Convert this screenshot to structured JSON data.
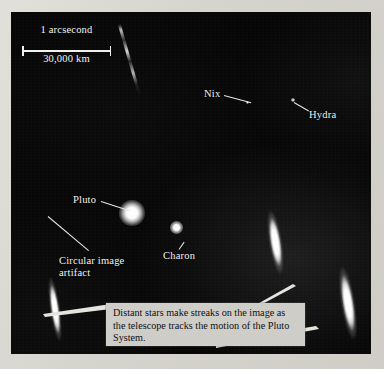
{
  "figure": {
    "kind": "telescope-photograph",
    "background_color": "#050505",
    "page_color": "#d8d6d0"
  },
  "scale_bar": {
    "top_label": "1 arcsecond",
    "bottom_label": "30,000 km"
  },
  "labels": {
    "nix": "Nix",
    "hydra": "Hydra",
    "pluto": "Pluto",
    "charon": "Charon",
    "artifact": "Circular image artifact"
  },
  "caption": {
    "text": "Distant stars make streaks on the image as the telescope tracks the motion of the Pluto System."
  },
  "objects": [
    {
      "name": "pluto",
      "x": 130,
      "y": 213,
      "size": 14,
      "brightness": "very-bright"
    },
    {
      "name": "charon",
      "x": 176,
      "y": 230,
      "size": 7,
      "brightness": "bright"
    },
    {
      "name": "nix",
      "x": 248,
      "y": 103,
      "size": 2.5,
      "brightness": "faint"
    },
    {
      "name": "hydra",
      "x": 293,
      "y": 100,
      "size": 3,
      "brightness": "faint"
    }
  ],
  "streaks": [
    {
      "name": "star-streak-upper-right",
      "x": 275,
      "y": 253,
      "length": 66,
      "width": 13,
      "tilt": -9
    },
    {
      "name": "star-streak-lower-right",
      "x": 347,
      "y": 310,
      "length": 74,
      "width": 13,
      "tilt": -9
    },
    {
      "name": "star-streak-lower-left",
      "x": 55,
      "y": 315,
      "length": 66,
      "width": 10,
      "tilt": -8
    },
    {
      "name": "star-trail-faint-diagonal",
      "x": 130,
      "y": 62,
      "length": 74,
      "width": 3,
      "tilt": -16
    }
  ]
}
